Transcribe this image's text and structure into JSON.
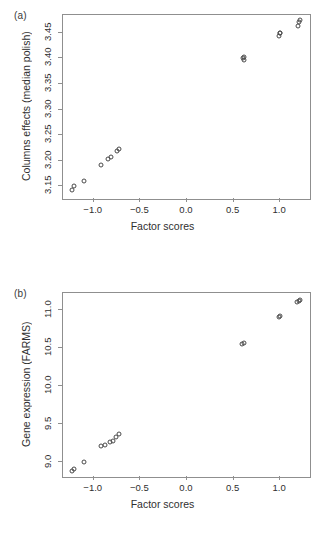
{
  "figure": {
    "panels": [
      {
        "letter": "(a)",
        "xlabel": "Factor scores",
        "ylabel": "Columns effects (median polish)"
      },
      {
        "letter": "(b)",
        "xlabel": "Factor scores",
        "ylabel": "Gene expression (FARMS)"
      }
    ]
  },
  "chart_data": [
    {
      "type": "scatter",
      "panel": "(a)",
      "title": "",
      "xlabel": "Factor scores",
      "ylabel": "Columns effects (median polish)",
      "xlim": [
        -1.33,
        1.32
      ],
      "ylim": [
        3.125,
        3.485
      ],
      "xticks": [
        -1.0,
        -0.5,
        0.0,
        0.5,
        1.0
      ],
      "xticklabels": [
        "-1.0",
        "-0.5",
        "0.0",
        "0.5",
        "1.0"
      ],
      "yticks": [
        3.15,
        3.2,
        3.25,
        3.3,
        3.35,
        3.4,
        3.45
      ],
      "yticklabels": [
        "3.15",
        "3.20",
        "3.25",
        "3.30",
        "3.35",
        "3.40",
        "3.45"
      ],
      "grid": false,
      "legend": "none",
      "marker": "open-circle",
      "x": [
        -1.235,
        -1.215,
        -1.105,
        -0.925,
        -0.845,
        -0.815,
        -0.755,
        -0.725,
        0.6,
        0.61,
        0.612,
        0.985,
        0.995,
        1.0,
        1.19,
        1.205,
        1.215
      ],
      "y": [
        3.142,
        3.15,
        3.16,
        3.192,
        3.203,
        3.208,
        3.218,
        3.223,
        3.401,
        3.403,
        3.397,
        3.444,
        3.449,
        3.45,
        3.463,
        3.472,
        3.476
      ]
    },
    {
      "type": "scatter",
      "panel": "(b)",
      "title": "",
      "xlabel": "Factor scores",
      "ylabel": "Gene expression (FARMS)",
      "xlim": [
        -1.33,
        1.32
      ],
      "ylim": [
        8.8,
        11.22
      ],
      "xticks": [
        -1.0,
        -0.5,
        0.0,
        0.5,
        1.0
      ],
      "xticklabels": [
        "-1.0",
        "-0.5",
        "0.0",
        "0.5",
        "1.0"
      ],
      "yticks": [
        9.0,
        9.5,
        10.0,
        10.5,
        11.0
      ],
      "yticklabels": [
        "9.0",
        "9.5",
        "10.0",
        "10.5",
        "11.0"
      ],
      "grid": false,
      "legend": "none",
      "marker": "open-circle",
      "x": [
        -1.235,
        -1.215,
        -1.105,
        -0.925,
        -0.875,
        -0.825,
        -0.795,
        -0.76,
        -0.725,
        0.595,
        0.615,
        0.985,
        1.0,
        1.185,
        1.2,
        1.215
      ],
      "y": [
        8.885,
        8.905,
        9.0,
        9.205,
        9.225,
        9.265,
        9.275,
        9.32,
        9.36,
        10.55,
        10.565,
        10.905,
        10.915,
        11.105,
        11.115,
        11.125
      ]
    }
  ]
}
